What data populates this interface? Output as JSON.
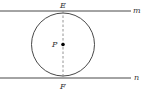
{
  "diagram": {
    "type": "geometry",
    "labels": {
      "top_tangent_point": "E",
      "bottom_tangent_point": "F",
      "center": "P",
      "top_line": "m",
      "bottom_line": "n"
    },
    "colors": {
      "stroke": "#333333",
      "dashed": "#888888",
      "point": "#000000"
    }
  }
}
